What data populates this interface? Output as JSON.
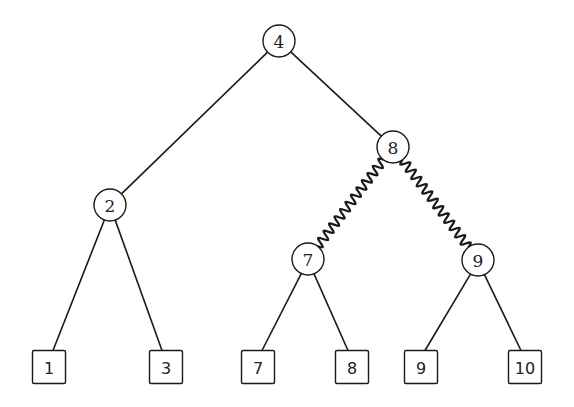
{
  "diagram": {
    "type": "binary-tree",
    "internal_nodes": [
      {
        "id": "n4",
        "label": "4",
        "x": 279,
        "y": 41
      },
      {
        "id": "n2",
        "label": "2",
        "x": 110,
        "y": 205
      },
      {
        "id": "n8",
        "label": "8",
        "x": 393,
        "y": 147
      },
      {
        "id": "n7",
        "label": "7",
        "x": 308,
        "y": 259
      },
      {
        "id": "n9",
        "label": "9",
        "x": 478,
        "y": 260
      }
    ],
    "leaves": [
      {
        "id": "l1",
        "label": "1",
        "x": 49,
        "y": 367
      },
      {
        "id": "l3",
        "label": "3",
        "x": 166,
        "y": 367
      },
      {
        "id": "l7",
        "label": "7",
        "x": 258,
        "y": 367
      },
      {
        "id": "l8",
        "label": "8",
        "x": 352,
        "y": 367
      },
      {
        "id": "l9",
        "label": "9",
        "x": 421,
        "y": 367
      },
      {
        "id": "l10",
        "label": "10",
        "x": 525,
        "y": 367
      }
    ],
    "edges": [
      {
        "from": "n4",
        "to": "n2",
        "style": "straight"
      },
      {
        "from": "n4",
        "to": "n8",
        "style": "straight"
      },
      {
        "from": "n8",
        "to": "n7",
        "style": "wavy"
      },
      {
        "from": "n8",
        "to": "n9",
        "style": "wavy"
      },
      {
        "from": "n2",
        "to": "l1",
        "style": "straight"
      },
      {
        "from": "n2",
        "to": "l3",
        "style": "straight"
      },
      {
        "from": "n7",
        "to": "l7",
        "style": "straight"
      },
      {
        "from": "n7",
        "to": "l8",
        "style": "straight"
      },
      {
        "from": "n9",
        "to": "l9",
        "style": "straight"
      },
      {
        "from": "n9",
        "to": "l10",
        "style": "straight"
      }
    ],
    "node_radius": 16,
    "leaf_size": 33
  }
}
